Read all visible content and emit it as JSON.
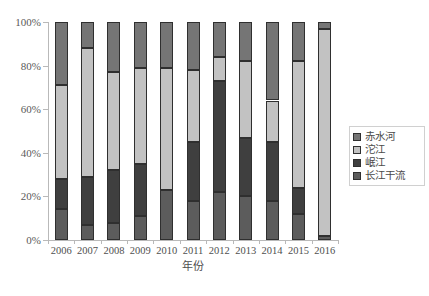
{
  "chart_data": {
    "type": "bar",
    "subtype": "100% stacked column",
    "title": "",
    "xlabel": "年份",
    "ylabel": "",
    "ylim": [
      0,
      100
    ],
    "ytick_labels": [
      "0%",
      "20%",
      "40%",
      "60%",
      "80%",
      "100%"
    ],
    "ytick_values": [
      0,
      20,
      40,
      60,
      80,
      100
    ],
    "grid": false,
    "legend_position": "right",
    "categories": [
      "2006",
      "2007",
      "2008",
      "2009",
      "2010",
      "2011",
      "2012",
      "2013",
      "2014",
      "2015",
      "2016"
    ],
    "series": [
      {
        "name": "长江干流",
        "color": "#5c5c5c",
        "values": [
          14,
          7,
          8,
          11,
          23,
          18,
          22,
          20,
          18,
          12,
          2
        ]
      },
      {
        "name": "岷江",
        "color": "#3f3f3f",
        "values": [
          14,
          22,
          24,
          24,
          0,
          27,
          51,
          27,
          27,
          12,
          0
        ]
      },
      {
        "name": "沱江",
        "color": "#c2c2c2",
        "values": [
          43,
          59,
          45,
          44,
          56,
          33,
          11,
          35,
          19,
          58,
          95
        ]
      },
      {
        "name": "赤水河",
        "color": "#757575",
        "values": [
          29,
          12,
          23,
          21,
          21,
          22,
          16,
          18,
          36,
          18,
          3
        ]
      }
    ]
  },
  "legend": {
    "items": [
      {
        "label": "赤水河",
        "color": "#757575"
      },
      {
        "label": "沱江",
        "color": "#c2c2c2"
      },
      {
        "label": "岷江",
        "color": "#3f3f3f"
      },
      {
        "label": "长江干流",
        "color": "#5c5c5c"
      }
    ]
  },
  "axis": {
    "x_title": "年份"
  },
  "caption": ""
}
